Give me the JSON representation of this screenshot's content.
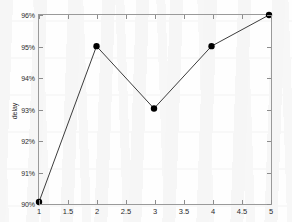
{
  "chart_data": {
    "type": "line",
    "title": "",
    "xlabel": "",
    "ylabel": "delay",
    "x": [
      1,
      2,
      3,
      4,
      5
    ],
    "values": [
      90,
      95,
      93,
      95,
      96
    ],
    "series": [
      {
        "name": "delay",
        "x": [
          1,
          2,
          3,
          4,
          5
        ],
        "values": [
          90,
          95,
          93,
          95,
          96
        ]
      }
    ],
    "xlim": [
      1,
      5
    ],
    "ylim": [
      90,
      96
    ],
    "xticks": [
      1,
      1.5,
      2,
      2.5,
      3,
      3.5,
      4,
      4.5,
      5
    ],
    "xticklabels": [
      "1",
      "1.5",
      "2",
      "2.5",
      "3",
      "3.5",
      "4",
      "4.5",
      "5"
    ],
    "yticks": [
      90,
      91,
      92,
      93,
      94,
      95,
      96
    ],
    "yticklabels": [
      "90%",
      "91%",
      "92%",
      "93%",
      "94%",
      "95%",
      "96%"
    ],
    "grid": false,
    "legend": null,
    "marker": "filled-circle",
    "line_color": "#3a3a3a",
    "marker_color": "#000000",
    "axis_color": "#9a9a9a",
    "background_color": "#fefefe"
  }
}
